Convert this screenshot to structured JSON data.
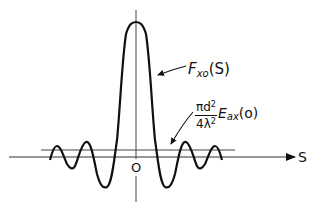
{
  "diagram": {
    "type": "sinc-like oscillating function",
    "curve_label": {
      "symbol": "F",
      "subscript": "xo",
      "argument": "(S)"
    },
    "reference_label": {
      "numerator": "πd",
      "numerator_sup": "2",
      "denominator": "4λ",
      "denominator_sup": "2",
      "symbol": "E",
      "subscript": "ax",
      "argument": "(o)"
    },
    "origin_label": "O",
    "x_axis_label": "S",
    "colors": {
      "curve": "#111111",
      "axes": "#333333",
      "background": "#ffffff"
    }
  }
}
